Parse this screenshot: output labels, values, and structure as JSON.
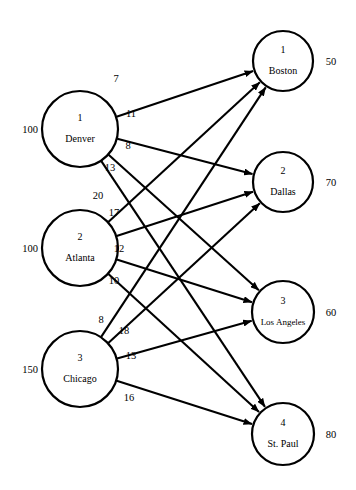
{
  "diagram": {
    "type": "transportation-network",
    "supply_nodes": [
      {
        "index": "1",
        "name": "Denver",
        "supply": "100",
        "cx": 80,
        "cy": 129,
        "r": 38
      },
      {
        "index": "2",
        "name": "Atlanta",
        "supply": "100",
        "cx": 80,
        "cy": 248,
        "r": 38
      },
      {
        "index": "3",
        "name": "Chicago",
        "supply": "150",
        "cx": 80,
        "cy": 369,
        "r": 38
      }
    ],
    "demand_nodes": [
      {
        "index": "1",
        "name": "Boston",
        "demand": "50",
        "cx": 283,
        "cy": 61,
        "r": 30
      },
      {
        "index": "2",
        "name": "Dallas",
        "demand": "70",
        "cx": 283,
        "cy": 182,
        "r": 30
      },
      {
        "index": "3",
        "name": "Los Angeles",
        "demand": "60",
        "cx": 283,
        "cy": 312,
        "r": 31
      },
      {
        "index": "4",
        "name": "St. Paul",
        "demand": "80",
        "cx": 283,
        "cy": 434,
        "r": 31
      }
    ],
    "edges": [
      {
        "from": "Denver",
        "to": "Boston",
        "cost": "7",
        "lx": 116,
        "ly": 82
      },
      {
        "from": "Denver",
        "to": "Dallas",
        "cost": "11",
        "lx": 131,
        "ly": 117
      },
      {
        "from": "Denver",
        "to": "Los Angeles",
        "cost": "8",
        "lx": 128,
        "ly": 149
      },
      {
        "from": "Denver",
        "to": "St. Paul",
        "cost": "13",
        "lx": 110,
        "ly": 171
      },
      {
        "from": "Atlanta",
        "to": "Boston",
        "cost": "20",
        "lx": 98,
        "ly": 199
      },
      {
        "from": "Atlanta",
        "to": "Dallas",
        "cost": "17",
        "lx": 114,
        "ly": 216
      },
      {
        "from": "Atlanta",
        "to": "Los Angeles",
        "cost": "12",
        "lx": 119,
        "ly": 252
      },
      {
        "from": "Atlanta",
        "to": "St. Paul",
        "cost": "10",
        "lx": 114,
        "ly": 284
      },
      {
        "from": "Chicago",
        "to": "Boston",
        "cost": "8",
        "lx": 101,
        "ly": 323
      },
      {
        "from": "Chicago",
        "to": "Dallas",
        "cost": "18",
        "lx": 124,
        "ly": 334
      },
      {
        "from": "Chicago",
        "to": "Los Angeles",
        "cost": "13",
        "lx": 131,
        "ly": 359
      },
      {
        "from": "Chicago",
        "to": "St. Paul",
        "cost": "16",
        "lx": 129,
        "ly": 401
      }
    ],
    "supply_label_x": 30,
    "demand_label_x": 331
  }
}
